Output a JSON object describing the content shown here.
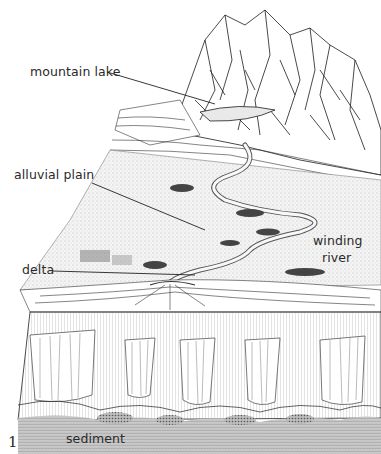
{
  "figure": {
    "number": "1",
    "labels": {
      "mountain_lake": "mountain lake",
      "alluvial_plain": "alluvial plain",
      "delta": "delta",
      "winding_river_line1": "winding",
      "winding_river_line2": "river",
      "sediment": "sediment"
    }
  }
}
